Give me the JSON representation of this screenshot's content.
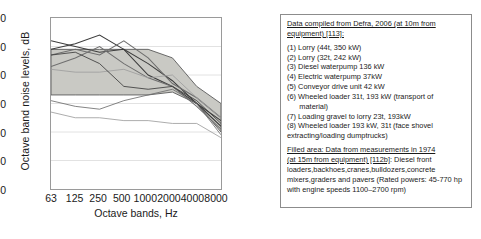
{
  "chart_data": {
    "type": "line",
    "title": "",
    "xlabel": "Octave bands, Hz",
    "ylabel": "Octave band noise levels, dB",
    "x": [
      63,
      125,
      250,
      500,
      1000,
      2000,
      4000,
      8000
    ],
    "xticklabels": [
      "63",
      "125",
      "250",
      "500",
      "1000",
      "2000",
      "4000",
      "8000"
    ],
    "xscale": "log",
    "ylim": [
      40,
      100
    ],
    "yticks": [
      40,
      50,
      60,
      70,
      80,
      90,
      100
    ],
    "yticklabels": [
      "40",
      "50",
      "60",
      "70",
      "80",
      "90",
      "100"
    ],
    "grid": true,
    "legend_position": "right-outside-box",
    "band": {
      "name": "Filled area: 1974 measurements at 15 m",
      "upper": [
        89,
        89,
        89,
        89,
        89,
        86,
        76,
        70
      ],
      "lower": [
        73,
        73,
        73,
        73,
        73,
        74,
        70,
        60
      ],
      "color": "#c9c9c4"
    },
    "series": [
      {
        "name": "(1) Lorry (44t, 350 kW)",
        "values": [
          92,
          90,
          88,
          89,
          84,
          78,
          70,
          62
        ]
      },
      {
        "name": "(2) Lorry (32t, 242 kW)",
        "values": [
          89,
          91,
          94,
          89,
          80,
          76,
          70,
          64
        ]
      },
      {
        "name": "(3) Diesel waterpump 136 kW",
        "values": [
          87,
          89,
          87,
          92,
          86,
          77,
          72,
          65
        ]
      },
      {
        "name": "(4) Electric waterpump 37kW",
        "values": [
          83,
          86,
          90,
          84,
          79,
          76,
          69,
          61
        ]
      },
      {
        "name": "(5) Conveyor drive unit 42 kW",
        "values": [
          82,
          81,
          81,
          82,
          79,
          80,
          72,
          65
        ]
      },
      {
        "name": "(6) Wheeled loader 31t, 193 kW",
        "values": [
          87,
          88,
          84,
          76,
          75,
          76,
          71,
          63
        ]
      },
      {
        "name": "(7) Loading gravel to lorry 23t, 193kW",
        "values": [
          71,
          69,
          68,
          71,
          73,
          75,
          70,
          59
        ]
      },
      {
        "name": "(8) Wheeled loader 193 kW, 31t",
        "values": [
          67,
          65,
          65,
          64,
          64,
          63,
          63,
          58
        ]
      }
    ]
  },
  "axes": {
    "ylabel": "Octave band noise levels, dB",
    "xlabel": "Octave bands, Hz",
    "yticks": [
      "100",
      "90",
      "80",
      "70",
      "60",
      "50",
      "40"
    ],
    "xticks": [
      "63",
      "125",
      "250",
      "500",
      "1000",
      "2000",
      "4000",
      "8000"
    ]
  },
  "legend": {
    "header_line1": "Data compiled from Defra, 2006 (at 10m from",
    "header_line2": "equipment) [113]:",
    "items": [
      "(1) Lorry (44t, 350 kW)",
      "(2) Lorry (32t, 242 kW)",
      "(3) Diesel waterpump 136 kW",
      "(4) Electric waterpump 37kW",
      "(5) Conveyor drive unit 42 kW",
      "(6) Wheeled loader 31t, 193 kW (transport of\n      material)",
      "(7) Loading gravel to lorry 23t, 193kW",
      "(8) Wheeled loader 193 kW, 31t (face shovel\nextracting/loading dumptrucks)"
    ],
    "filled_head_line1": "Filled area: Data from measurements in 1974",
    "filled_head_line2": "(at 15m from equipment) [112b]",
    "filled_body": ": Diesel front loaders,backhoes,cranes,bulldozers,concrete mixers,graders and pavers (Rated powers: 45-770 hp with engine speeds 1100–2700 rpm)"
  },
  "colors": {
    "band_fill": "#c9c9c4",
    "line_dark": "#3c3c3c",
    "line_mid": "#6e6e6e",
    "line_light": "#9e9e9e",
    "frame": "#9a9a9a",
    "grid": "#e2e2e2"
  }
}
